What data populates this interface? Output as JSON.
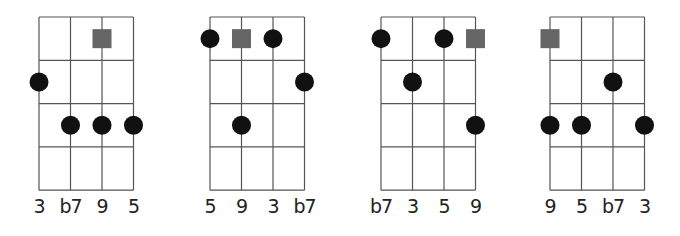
{
  "diagrams": [
    {
      "origin_x": 39,
      "root": {
        "string": 2,
        "fret": 1
      },
      "dots": [
        {
          "string": 0,
          "fret": 2
        },
        {
          "string": 1,
          "fret": 3
        },
        {
          "string": 2,
          "fret": 3
        },
        {
          "string": 3,
          "fret": 3
        }
      ],
      "labels": [
        "3",
        "b7",
        "9",
        "5"
      ]
    },
    {
      "origin_x": 210,
      "root": {
        "string": 1,
        "fret": 1
      },
      "dots": [
        {
          "string": 0,
          "fret": 1
        },
        {
          "string": 2,
          "fret": 1
        },
        {
          "string": 3,
          "fret": 2
        },
        {
          "string": 1,
          "fret": 3
        }
      ],
      "labels": [
        "5",
        "9",
        "3",
        "b7"
      ]
    },
    {
      "origin_x": 381,
      "root": {
        "string": 3,
        "fret": 1
      },
      "dots": [
        {
          "string": 0,
          "fret": 1
        },
        {
          "string": 2,
          "fret": 1
        },
        {
          "string": 1,
          "fret": 2
        },
        {
          "string": 3,
          "fret": 3
        }
      ],
      "labels": [
        "b7",
        "3",
        "5",
        "9"
      ]
    },
    {
      "origin_x": 550,
      "root": {
        "string": 0,
        "fret": 1
      },
      "dots": [
        {
          "string": 2,
          "fret": 2
        },
        {
          "string": 0,
          "fret": 3
        },
        {
          "string": 1,
          "fret": 3
        },
        {
          "string": 3,
          "fret": 3
        }
      ],
      "labels": [
        "9",
        "5",
        "b7",
        "3"
      ]
    }
  ],
  "grid": {
    "strings": 4,
    "frets": 4,
    "string_spacing": 31.5,
    "fret_spacing": 43.3,
    "top": 17
  },
  "colors": {
    "line": "#555555",
    "dot": "#111111",
    "root": "#666666"
  }
}
